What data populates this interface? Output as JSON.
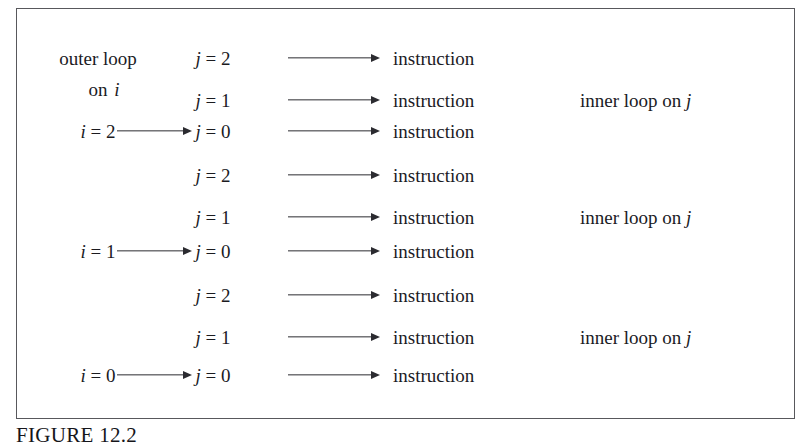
{
  "figure": {
    "caption": "FIGURE 12.2",
    "box_border_color": "#58585c",
    "text_color": "#1b1b1f",
    "arrow_color": "#2b2b30"
  },
  "labels": {
    "outer_loop_line1": "outer loop",
    "outer_loop_line2_prefix": "on",
    "outer_loop_line2_var": "i",
    "inner_loop_prefix": "inner loop on",
    "inner_loop_var": "j",
    "instruction": "instruction"
  },
  "columns": {
    "outer_header": "outer loop on i",
    "i_column": "i",
    "j_column": "j",
    "instruction_column": "instruction",
    "inner_column": "inner loop on j"
  },
  "rows": [
    {
      "index": 0,
      "j_var": "j",
      "j_value": "2",
      "i_var": null,
      "i_value": null,
      "has_i_arrow": false,
      "instruction": "instruction",
      "inner_label": null
    },
    {
      "index": 1,
      "j_var": "j",
      "j_value": "1",
      "i_var": null,
      "i_value": null,
      "has_i_arrow": false,
      "instruction": "instruction",
      "inner_label": "inner loop on j"
    },
    {
      "index": 2,
      "j_var": "j",
      "j_value": "0",
      "i_var": "i",
      "i_value": "2",
      "has_i_arrow": true,
      "instruction": "instruction",
      "inner_label": null
    },
    {
      "index": 3,
      "j_var": "j",
      "j_value": "2",
      "i_var": null,
      "i_value": null,
      "has_i_arrow": false,
      "instruction": "instruction",
      "inner_label": null
    },
    {
      "index": 4,
      "j_var": "j",
      "j_value": "1",
      "i_var": null,
      "i_value": null,
      "has_i_arrow": false,
      "instruction": "instruction",
      "inner_label": "inner loop on j"
    },
    {
      "index": 5,
      "j_var": "j",
      "j_value": "0",
      "i_var": "i",
      "i_value": "1",
      "has_i_arrow": true,
      "instruction": "instruction",
      "inner_label": null
    },
    {
      "index": 6,
      "j_var": "j",
      "j_value": "2",
      "i_var": null,
      "i_value": null,
      "has_i_arrow": false,
      "instruction": "instruction",
      "inner_label": null
    },
    {
      "index": 7,
      "j_var": "j",
      "j_value": "1",
      "i_var": null,
      "i_value": null,
      "has_i_arrow": false,
      "instruction": "instruction",
      "inner_label": "inner loop on j"
    },
    {
      "index": 8,
      "j_var": "j",
      "j_value": "0",
      "i_var": "i",
      "i_value": "0",
      "has_i_arrow": true,
      "instruction": "instruction",
      "inner_label": null
    }
  ],
  "equals": "=",
  "geometry": {
    "row_y": [
      58,
      100,
      131,
      175,
      217,
      251,
      295,
      337,
      375
    ],
    "i_x": 98,
    "j_x": 213,
    "instruction_x": 393,
    "inner_x": 580,
    "i_arrow_x": 117,
    "i_arrow_w": 75,
    "instr_arrow_x": 288,
    "instr_arrow_w": 92
  }
}
